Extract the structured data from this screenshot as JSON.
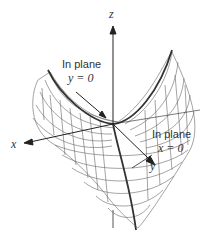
{
  "figure": {
    "type": "3d-surface",
    "axes": {
      "x": "x",
      "y": "y",
      "z": "z"
    },
    "annotations": [
      {
        "line1": "In plane",
        "line2": "y = 0"
      },
      {
        "line1": "In plane",
        "line2": "x = 0"
      }
    ],
    "colors": {
      "mesh": "#555555",
      "axis": "#222222",
      "curve": "#333333",
      "background": "#ffffff"
    }
  }
}
